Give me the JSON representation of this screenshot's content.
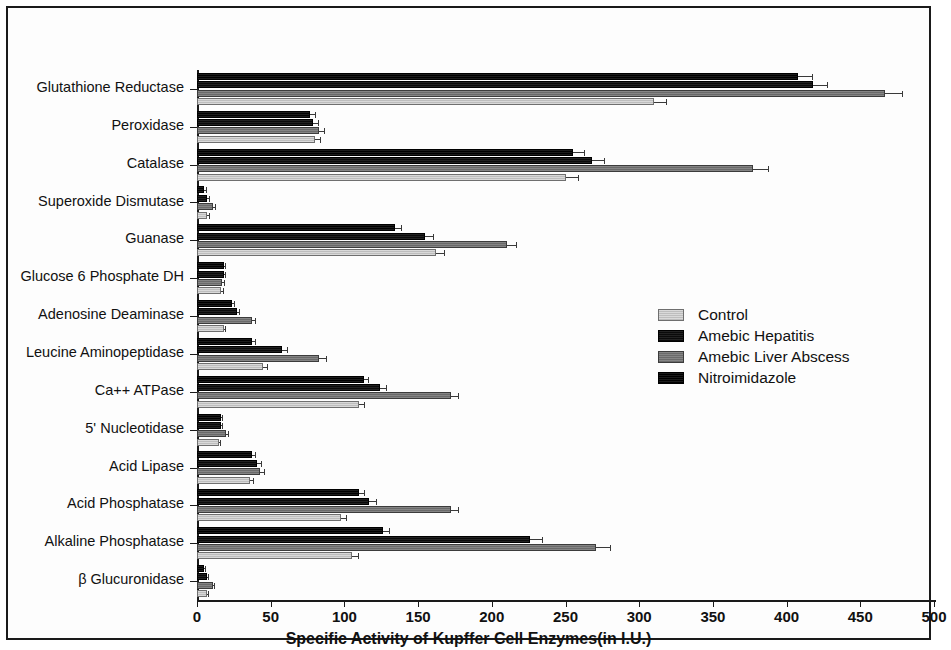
{
  "chart_data": {
    "type": "bar",
    "orientation": "horizontal",
    "title": "",
    "xlabel": "Specific Activity of Kupffer Cell Enzymes(in I.U.)",
    "ylabel": "",
    "xlim": [
      0,
      500
    ],
    "xticks": [
      0,
      50,
      100,
      150,
      200,
      250,
      300,
      350,
      400,
      450,
      500
    ],
    "grid": false,
    "legend_position": "right-center",
    "categories": [
      "Glutathione Reductase",
      "Peroxidase",
      "Catalase",
      "Superoxide Dismutase",
      "Guanase",
      "Glucose 6 Phosphate DH",
      "Adenosine Deaminase",
      "Leucine Aminopeptidase",
      "Ca++ ATPase",
      "5' Nucleotidase",
      "Acid Lipase",
      "Acid Phosphatase",
      "Alkaline Phosphatase",
      "β Glucuronidase"
    ],
    "series": [
      {
        "name": "Nitroimidazole",
        "color": "#0d0d0d",
        "values": [
          408,
          77,
          255,
          5,
          134,
          18,
          24,
          37,
          113,
          16,
          37,
          110,
          126,
          5
        ],
        "errors": [
          10,
          4,
          8,
          1.5,
          5,
          2,
          2,
          3,
          4,
          1.5,
          3,
          4,
          5,
          1
        ]
      },
      {
        "name": "Amebic Hepatitis",
        "color": "#141414",
        "values": [
          418,
          79,
          268,
          7,
          155,
          18,
          27,
          58,
          124,
          16,
          41,
          117,
          226,
          7
        ],
        "errors": [
          10,
          4,
          9,
          1.5,
          6,
          2,
          2,
          4,
          5,
          1.5,
          3,
          5,
          9,
          1
        ]
      },
      {
        "name": "Amebic Liver Abscess",
        "color": "#777777",
        "values": [
          467,
          83,
          377,
          11,
          210,
          17,
          37,
          83,
          172,
          20,
          43,
          172,
          271,
          11
        ],
        "errors": [
          12,
          4,
          11,
          2,
          7,
          2,
          3,
          5,
          6,
          2,
          3,
          6,
          10,
          1.5
        ]
      },
      {
        "name": "Control",
        "color": "#c9c9c9",
        "values": [
          310,
          80,
          250,
          7,
          162,
          16,
          18,
          45,
          110,
          15,
          36,
          98,
          105,
          7
        ],
        "errors": [
          9,
          4,
          9,
          1.5,
          6,
          2,
          2,
          3,
          4,
          1.5,
          3,
          4,
          5,
          1
        ]
      }
    ]
  },
  "legend": {
    "items": [
      {
        "label": "Control",
        "swatch_class": "s-control"
      },
      {
        "label": "Amebic Hepatitis",
        "swatch_class": "s-hep"
      },
      {
        "label": "Amebic Liver Abscess",
        "swatch_class": "s-abs"
      },
      {
        "label": "Nitroimidazole",
        "swatch_class": "s-nit"
      }
    ]
  }
}
